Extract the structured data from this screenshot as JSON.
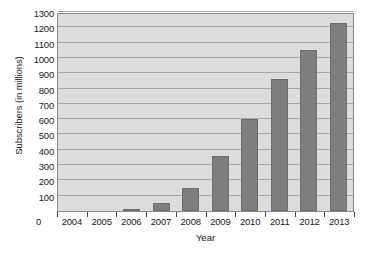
{
  "chart_data": {
    "type": "bar",
    "title": "",
    "xlabel": "Year",
    "ylabel": "Subscribers (in millions)",
    "categories": [
      "2004",
      "2005",
      "2006",
      "2007",
      "2008",
      "2009",
      "2010",
      "2011",
      "2012",
      "2013"
    ],
    "values": [
      0,
      2,
      12,
      50,
      150,
      360,
      600,
      860,
      1050,
      1230
    ],
    "ylim": [
      0,
      1300
    ],
    "ytick_labels": [
      "0",
      "100",
      "200",
      "300",
      "400",
      "500",
      "600",
      "700",
      "800",
      "900",
      "1000",
      "1100",
      "1200",
      "1300"
    ],
    "ytick_values": [
      0,
      100,
      200,
      300,
      400,
      500,
      600,
      700,
      800,
      900,
      1000,
      1100,
      1200,
      1300
    ],
    "grid": true,
    "legend": "none",
    "zero_label": "0",
    "colors": {
      "bar_fill": "#7e7e7e",
      "bar_edge": "#6d6d6d",
      "plot_background": "#dcdcdc",
      "gridline": "#a8a8a8",
      "axis": "#8a8a8a",
      "text": "#1a1a1a",
      "page_background": "#ffffff"
    }
  }
}
